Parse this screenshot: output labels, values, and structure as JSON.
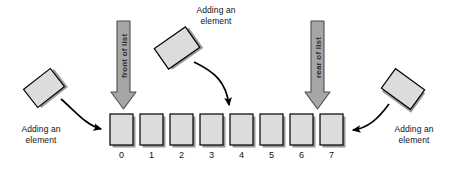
{
  "figure": {
    "background_color": "#ffffff"
  },
  "colors": {
    "cell_fill": "#dcdcdc",
    "cell_stroke": "#000000",
    "cell_shadow": "#9a9a9a",
    "block_arrow_fill": "#a6a6a6",
    "block_arrow_stroke": "#4d4d4d",
    "curve_arrow": "#000000",
    "text": "#111111"
  },
  "list": {
    "label": "array-based list",
    "cells": [
      {
        "index_label": "0",
        "value": ""
      },
      {
        "index_label": "1",
        "value": ""
      },
      {
        "index_label": "2",
        "value": ""
      },
      {
        "index_label": "3",
        "value": ""
      },
      {
        "index_label": "4",
        "value": ""
      },
      {
        "index_label": "5",
        "value": ""
      },
      {
        "index_label": "6",
        "value": ""
      },
      {
        "index_label": "7",
        "value": ""
      }
    ]
  },
  "block_arrows": [
    {
      "id": "front",
      "label": "front of list",
      "target_index": "0",
      "direction": "down"
    },
    {
      "id": "rear",
      "label": "rear of list",
      "target_index": "7",
      "direction": "down"
    }
  ],
  "annotations": {
    "left": {
      "label": "Adding an\nelement",
      "target_index": "0"
    },
    "middle": {
      "label": "Adding an\nelement",
      "target_index": "4"
    },
    "right": {
      "label": "Adding an\nelement",
      "target_index": "7"
    }
  }
}
